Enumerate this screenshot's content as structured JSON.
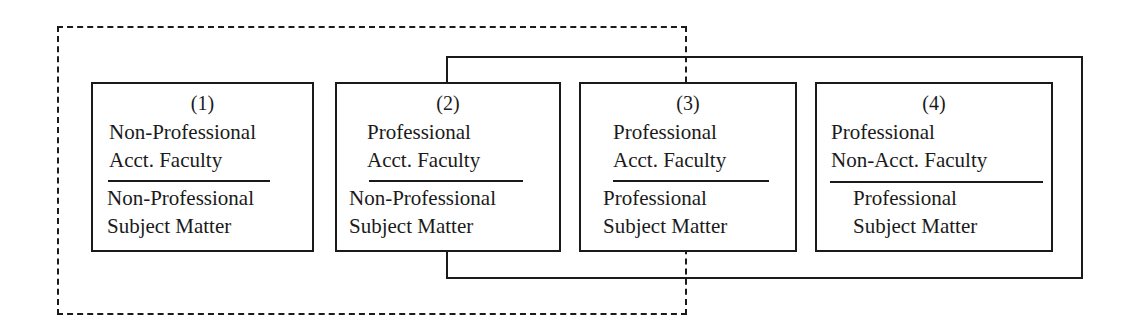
{
  "diagram": {
    "type": "grouping-boxes",
    "groupings": {
      "dashed_group": {
        "members": [
          1,
          2,
          3
        ],
        "style": "dashed"
      },
      "solid_group": {
        "members": [
          2,
          3,
          4
        ],
        "style": "solid"
      }
    },
    "boxes": [
      {
        "number": "(1)",
        "faculty_line1": "Non-Professional",
        "faculty_line2": "Acct. Faculty",
        "subject_line1": "Non-Professional",
        "subject_line2": "Subject Matter"
      },
      {
        "number": "(2)",
        "faculty_line1": "Professional",
        "faculty_line2": "Acct. Faculty",
        "subject_line1": "Non-Professional",
        "subject_line2": "Subject Matter"
      },
      {
        "number": "(3)",
        "faculty_line1": "Professional",
        "faculty_line2": "Acct. Faculty",
        "subject_line1": "Professional",
        "subject_line2": "Subject Matter"
      },
      {
        "number": "(4)",
        "faculty_line1": "Professional",
        "faculty_line2": "Non-Acct. Faculty",
        "subject_line1": "Professional",
        "subject_line2": "Subject Matter"
      }
    ]
  }
}
